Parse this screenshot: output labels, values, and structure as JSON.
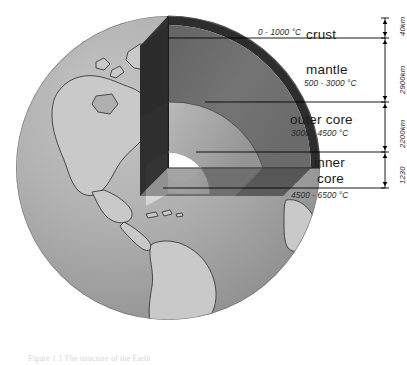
{
  "diagram": {
    "caption": "Figure 1.1  The structure of the Earth"
  },
  "layers": [
    {
      "id": "crust",
      "name": "crust",
      "temperature": "0 - 1000 °C",
      "thickness": "40 km",
      "scale_text": "40km",
      "color": "#3b3b3b"
    },
    {
      "id": "mantle",
      "name": "mantle",
      "temperature": "500 - 3000 °C",
      "thickness": "2900 km",
      "scale_text": "2900km",
      "color": "#6f6f6f"
    },
    {
      "id": "outer-core",
      "name": "outer core",
      "temperature": "3000 - 4500 °C",
      "thickness": "2200 km",
      "scale_text": "2200km",
      "color": "#a8a8a8"
    },
    {
      "id": "inner-core",
      "name_line1": "inner",
      "name_line2": "core",
      "name": "inner core",
      "temperature": "4500 - 6500 °C",
      "thickness": "1230 km",
      "scale_text": "1230",
      "color": "#f2f2f2"
    }
  ],
  "colors": {
    "ocean": "#9d9d9d",
    "ocean_light": "#b4b4b4",
    "land": "#c9c9c9",
    "coastline": "#3a3a3a",
    "cut_face_dark": "#2e2e2e",
    "cut_face_mid": "#555555",
    "mantle_face": "#6b6b6b",
    "mantle_side": "#4a4a4a",
    "outer_core_face": "#9a9a9a",
    "outer_core_side": "#7d7d7d",
    "inner_core_face": "#ffffff",
    "inner_core_side": "#d0d0d0",
    "leader_line": "#000000",
    "background": "#ffffff"
  },
  "leader_lines": {
    "crust_y": 38,
    "mantle_y": 102,
    "outer_core_y": 152,
    "inner_core_y": 188
  },
  "scale_bar": {
    "x": 385,
    "top": 18,
    "ticks": [
      18,
      38,
      102,
      152,
      188
    ]
  }
}
